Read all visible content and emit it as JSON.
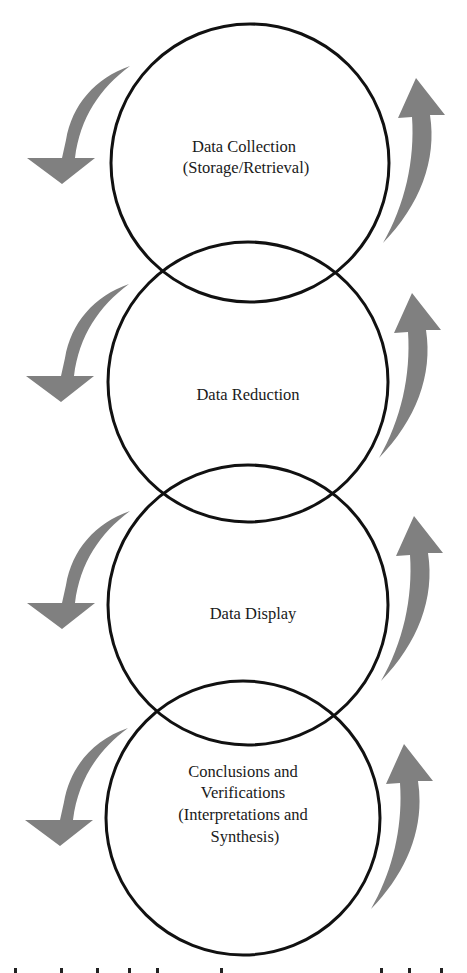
{
  "diagram": {
    "type": "cyclic-overlapping-circles",
    "colors": {
      "circle_stroke": "#111111",
      "arrow_fill": "#808080",
      "background": "#ffffff"
    },
    "stages": [
      {
        "id": "collection",
        "lines": [
          "Data Collection",
          "(Storage/Retrieval)"
        ]
      },
      {
        "id": "reduction",
        "lines": [
          "Data Reduction"
        ]
      },
      {
        "id": "display",
        "lines": [
          "Data Display"
        ]
      },
      {
        "id": "conclusions",
        "lines": [
          "Conclusions and",
          "Verifications",
          "(Interpretations and",
          "Synthesis)"
        ]
      }
    ],
    "arrows": {
      "left": {
        "direction": "down",
        "icon": "curved-arrow-down-left-icon",
        "count": 4
      },
      "right": {
        "direction": "up",
        "icon": "curved-arrow-up-right-icon",
        "count": 4
      }
    }
  }
}
